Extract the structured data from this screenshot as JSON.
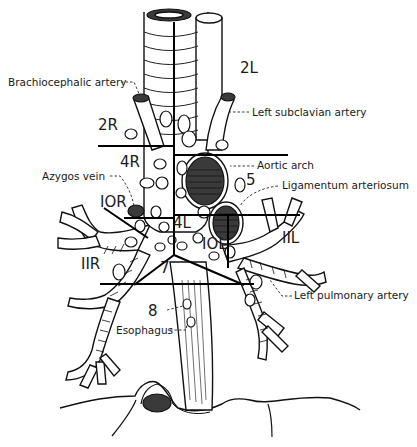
{
  "figure": {
    "stations": [
      {
        "id": "2R",
        "label": "2R",
        "x": 98,
        "y": 130
      },
      {
        "id": "2L",
        "label": "2L",
        "x": 240,
        "y": 73
      },
      {
        "id": "4R",
        "label": "4R",
        "x": 120,
        "y": 167
      },
      {
        "id": "4L",
        "label": "4L",
        "x": 173,
        "y": 228
      },
      {
        "id": "5",
        "label": "5",
        "x": 246,
        "y": 185
      },
      {
        "id": "10R",
        "label": "IOR",
        "x": 100,
        "y": 207
      },
      {
        "id": "10L",
        "label": "IOL",
        "x": 202,
        "y": 249
      },
      {
        "id": "11R",
        "label": "IIR",
        "x": 81,
        "y": 269
      },
      {
        "id": "11L",
        "label": "IIL",
        "x": 282,
        "y": 243
      },
      {
        "id": "7",
        "label": "7",
        "x": 160,
        "y": 273
      },
      {
        "id": "8",
        "label": "8",
        "x": 148,
        "y": 316
      }
    ],
    "annotations": [
      {
        "id": "brachiocephalic-artery",
        "text": "Brachiocephalic artery",
        "x": 8,
        "y": 86
      },
      {
        "id": "left-subclavian-artery",
        "text": "Left subclavian artery",
        "x": 252,
        "y": 116
      },
      {
        "id": "aortic-arch",
        "text": "Aortic arch",
        "x": 257,
        "y": 169
      },
      {
        "id": "ligamentum-arteriosum",
        "text": "Ligamentum arteriosum",
        "x": 282,
        "y": 189
      },
      {
        "id": "azygos-vein",
        "text": "Azygos vein",
        "x": 42,
        "y": 180
      },
      {
        "id": "left-pulmonary-artery",
        "text": "Left pulmonary artery",
        "x": 294,
        "y": 296
      },
      {
        "id": "esophagus",
        "text": "Esophagus",
        "x": 116,
        "y": 335
      }
    ]
  }
}
